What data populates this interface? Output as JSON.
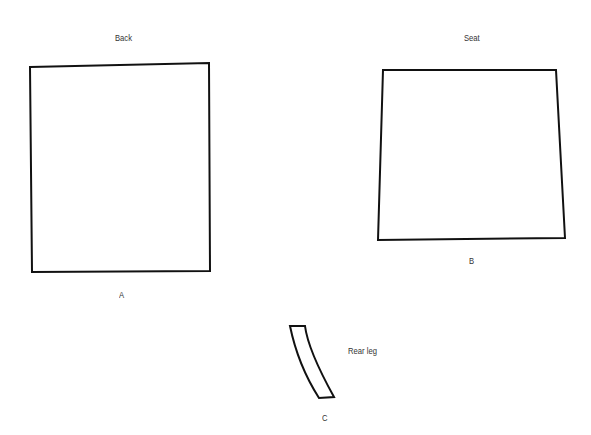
{
  "pieces": [
    {
      "id": "A",
      "title": "Back",
      "letter": "A"
    },
    {
      "id": "B",
      "title": "Seat",
      "letter": "B"
    },
    {
      "id": "C",
      "title": "Rear leg",
      "letter": "C"
    }
  ],
  "colors": {
    "outline": "#111111",
    "text": "#333333",
    "background": "#ffffff"
  }
}
